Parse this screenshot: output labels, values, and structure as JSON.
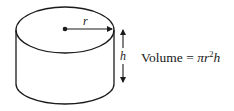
{
  "diagram": {
    "labels": {
      "radius": "r",
      "height": "h"
    },
    "formula": {
      "lhs": "Volume",
      "equals": " = ",
      "pi": "π",
      "r": "r",
      "exp": "2",
      "h": "h"
    },
    "colors": {
      "stroke": "#1a1a1a",
      "background": "#ffffff"
    }
  }
}
